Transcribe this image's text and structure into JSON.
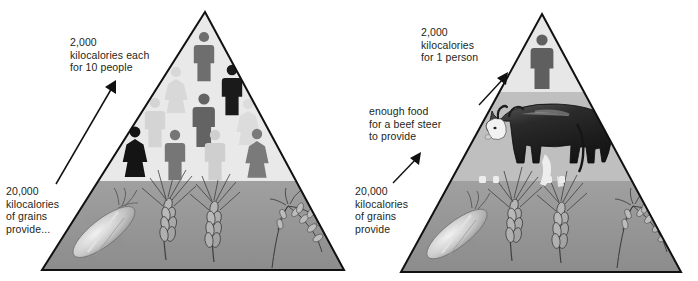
{
  "figure": {
    "panels": [
      {
        "id": "left",
        "name": "grains-to-people",
        "labels": {
          "top": "2,000\nkilocalories each\nfor 10 people",
          "bottom": "20,000\nkilocalories\nof grains\nprovide..."
        },
        "tiers": [
          {
            "name": "people-tier",
            "kilocalories": 2000,
            "consumers": 10,
            "icon": "person-icon",
            "fill": "#e8e8e8"
          },
          {
            "name": "grains-tier",
            "kilocalories": 20000,
            "items": [
              "corn-ear",
              "wheat-ear",
              "barley-ear",
              "rice-plant"
            ],
            "fill": "#8c8c8c"
          }
        ],
        "people": [
          {
            "sex": "male",
            "shade": "#6e6e6e"
          },
          {
            "sex": "female",
            "shade": "#d8d8d8"
          },
          {
            "sex": "male",
            "shade": "#1a1a1a"
          },
          {
            "sex": "male",
            "shade": "#d4d4d4"
          },
          {
            "sex": "male",
            "shade": "#636363"
          },
          {
            "sex": "female",
            "shade": "#dcdcdc"
          },
          {
            "sex": "female",
            "shade": "#141414"
          },
          {
            "sex": "male",
            "shade": "#767676"
          },
          {
            "sex": "male",
            "shade": "#cfcfcf"
          },
          {
            "sex": "female",
            "shade": "#7a7a7a"
          }
        ]
      },
      {
        "id": "right",
        "name": "grains-to-steer-to-person",
        "labels": {
          "top": "2,000\nkilocalories\nfor 1 person",
          "middle": "enough food\nfor a beef steer\nto provide",
          "bottom": "20,000\nkilocalories\nof grains\nprovide"
        },
        "tiers": [
          {
            "name": "person-tier",
            "kilocalories": 2000,
            "consumers": 1,
            "icon": "person-icon",
            "fill": "#e4e4e4"
          },
          {
            "name": "steer-tier",
            "icon": "beef-steer",
            "fill": "#bdbdbd"
          },
          {
            "name": "grains-tier",
            "kilocalories": 20000,
            "items": [
              "corn-ear",
              "wheat-ear",
              "barley-ear",
              "rice-plant"
            ],
            "fill": "#8c8c8c"
          }
        ],
        "people": [
          {
            "sex": "male",
            "shade": "#5f5f5f"
          }
        ]
      }
    ],
    "colors": {
      "outline": "#111111",
      "text": "#231f20",
      "tier_light": "#e8e8e8",
      "tier_mid": "#bdbdbd",
      "tier_dark": "#8c8c8c",
      "arrow": "#111111"
    }
  }
}
